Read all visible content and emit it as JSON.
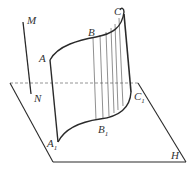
{
  "diagram": {
    "colors": {
      "stroke": "#2a2a2a",
      "dashed": "#888888",
      "label": "#333333"
    },
    "labels": {
      "M": "M",
      "N": "N",
      "A": "A",
      "B": "B",
      "C": "C",
      "A1": "A",
      "A1_sub": "1",
      "B1": "B",
      "B1_sub": "1",
      "C1": "C",
      "C1_sub": "1",
      "H": "H"
    }
  }
}
